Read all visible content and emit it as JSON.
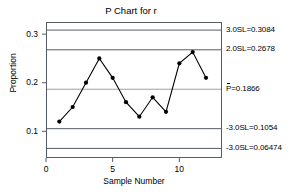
{
  "chart_data": {
    "type": "line",
    "title": "P Chart for r",
    "xlabel": "Sample Number",
    "ylabel": "Proportion",
    "x": [
      1,
      2,
      3,
      4,
      5,
      6,
      7,
      8,
      9,
      10,
      11,
      12
    ],
    "values": [
      0.12,
      0.15,
      0.2,
      0.25,
      0.21,
      0.16,
      0.13,
      0.17,
      0.14,
      0.24,
      0.263,
      0.21
    ],
    "xlim": [
      0,
      13.2
    ],
    "ylim": [
      0.045,
      0.325
    ],
    "xticks": [
      "0",
      "5",
      "10"
    ],
    "xtick_values": [
      0,
      5,
      10
    ],
    "yticks": [
      "0.1",
      "0.2",
      "0.3"
    ],
    "ytick_values": [
      0.1,
      0.2,
      0.3
    ],
    "grid": false,
    "legend": "none",
    "marker": "filled-circle",
    "line_color": "#000000",
    "control_lines": [
      {
        "name": "upper-3-sigma",
        "label_prefix": "3.0SL=",
        "label_value": "0.3084",
        "label": "3.0SL=0.3084",
        "value": 0.3084,
        "color": "#555c63"
      },
      {
        "name": "upper-2-sigma",
        "label_prefix": "2.0SL=",
        "label_value": "0.2678",
        "label": "2.0SL=0.2678",
        "value": 0.2678,
        "color": "#555c63"
      },
      {
        "name": "center-line",
        "label_prefix": "P=",
        "label_value": "0.1866",
        "label": "P=0.1866",
        "value": 0.1866,
        "color": "#9aa0a6",
        "overbar": true
      },
      {
        "name": "lower-2-sigma",
        "label_prefix": "-3.0SL=",
        "label_value": "0.1054",
        "label": "-3.0SL=0.1054",
        "value": 0.1054,
        "color": "#555c63"
      },
      {
        "name": "lower-3-sigma",
        "label_prefix": "-3.0SL=",
        "label_value": "0.06474",
        "label": "-3.0SL=0.06474",
        "value": 0.06474,
        "color": "#555c63"
      }
    ]
  },
  "axis": {
    "y_title": "Proportion",
    "x_title": "Sample Number"
  }
}
